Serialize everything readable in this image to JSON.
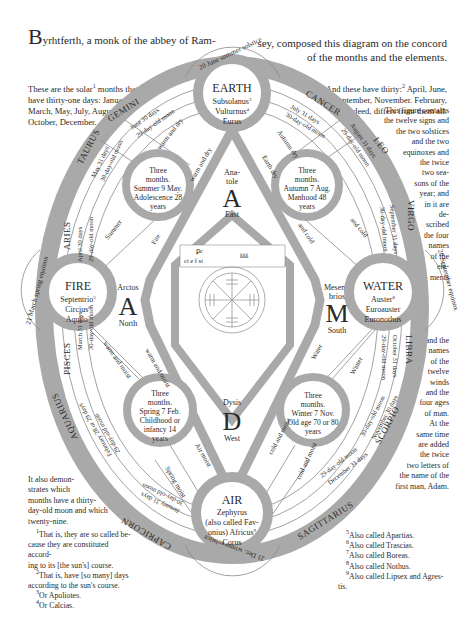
{
  "header": {
    "dropcap": "B",
    "title_left": "yrhtferth, a monk of the abbey of Ram-",
    "title_right_line1": "sey, composed this diagram on the concord",
    "title_right_line2": "of the months and the elements."
  },
  "side_text": {
    "top_left": [
      "These are the solar",
      "1",
      " months that",
      "have thirty-one days: January,",
      "March, May, July, August,",
      "October, December."
    ],
    "top_right": [
      "And these have thirty:",
      "2",
      " April, June,",
      "September, November. February,",
      "indeed, differs from them all."
    ],
    "right_column": [
      "This figure contains",
      "the twelve signs and",
      "the two solstices",
      "and the two",
      "equinoxes and",
      "the twice",
      "two sea-",
      "sons of the",
      "year; and",
      "in it are",
      "de-",
      "scribed",
      "the four",
      "names",
      "of the",
      "ele-",
      "ments",
      "",
      "and the",
      "names",
      "of the",
      "twelve",
      "winds",
      "and the",
      "four ages",
      "of man.",
      "At the",
      "same time",
      "are added",
      "the twice",
      "two letters of",
      "the name of the",
      "first man, Adam."
    ],
    "bottom_left": [
      "It also demon-",
      "strates which",
      "months have a thirty-",
      "day-old moon and which",
      "twenty-nine."
    ]
  },
  "footnotes": {
    "left": [
      {
        "num": "1",
        "text": "That is, they are so called be-"
      },
      {
        "num": "",
        "text": "cause they are constituted accord-"
      },
      {
        "num": "",
        "text": "ing to its [the sun's] course."
      },
      {
        "num": "2",
        "text": "That is, have [so many] days"
      },
      {
        "num": "",
        "text": "according to the sun's course."
      },
      {
        "num": "3",
        "text": "Or Apoliotes."
      },
      {
        "num": "4",
        "text": "Or Calcias."
      }
    ],
    "right": [
      {
        "num": "5",
        "text": "Also called Apartias."
      },
      {
        "num": "6",
        "text": "Also called Trascias."
      },
      {
        "num": "7",
        "text": "Also called Boreas."
      },
      {
        "num": "8",
        "text": "Also called Nothus."
      },
      {
        "num": "9",
        "text": "Also called Lipsex and Agres-"
      },
      {
        "num": "",
        "text": "tis."
      }
    ]
  },
  "diagram": {
    "colors": {
      "band": "#a9a9a9",
      "line": "#8a8a8a",
      "text": "#2a2a2a",
      "bg": "#ffffff"
    },
    "elements": {
      "earth": {
        "name": "EARTH",
        "winds": [
          "Subsolanus",
          "Vulturnus",
          "Eurus"
        ],
        "notes": [
          "3",
          "4",
          ""
        ]
      },
      "fire": {
        "name": "FIRE",
        "winds": [
          "Septentrio",
          "Circius",
          "Aquilo"
        ],
        "notes": [
          "5",
          "6",
          "7"
        ]
      },
      "water": {
        "name": "WATER",
        "winds": [
          "Auster",
          "Euroauster",
          "Euronothus"
        ],
        "notes": [
          "8",
          "",
          ""
        ]
      },
      "air": {
        "name": "AIR",
        "winds": [
          "Zephyrus",
          "(also called Fav-",
          "onius) Africus",
          "Corus"
        ],
        "notes": [
          "",
          "",
          "9",
          ""
        ]
      }
    },
    "solstices_equinoxes": {
      "summer": "20 June summer solstice",
      "winter": "21 Dec. winter solstice",
      "spring": "21 March spring equinox",
      "autumn": "20 September equinox"
    },
    "zodiac": [
      "GEMINI",
      "CANCER",
      "LEO",
      "VIRGO",
      "LIBRA",
      "SCORPIO",
      "SAGITTARIUS",
      "CAPRICORN",
      "AQUARIUS",
      "PISCES",
      "ARIES",
      "TAURUS"
    ],
    "months": {
      "june": [
        "June 30 days",
        "29-day-old moon"
      ],
      "july": [
        "July 31 days",
        "30-day-old moon"
      ],
      "august": [
        "August 31 days",
        "29-day-old moon"
      ],
      "september": [
        "September 31 days",
        "30-day-old moon"
      ],
      "october": [
        "October 31 days",
        "29-day-old moon"
      ],
      "november": [
        "November 30 days",
        "30-day-old moon"
      ],
      "december": [
        "December 31 days",
        "29-day-old moon"
      ],
      "january": [
        "January 31 days",
        "30-day-old moon"
      ],
      "february": [
        "February 28 or 29 days",
        "29-day-old moon"
      ],
      "march": [
        "March 31 days",
        "30-day-old moon"
      ],
      "april": [
        "April 30 days",
        "29-day-old moon"
      ],
      "may": [
        "May 31 days",
        "30-day-old moon"
      ]
    },
    "seasons": {
      "summer": [
        "Three",
        "months.",
        "Summer 9 May.",
        "Adolescence 28",
        "years"
      ],
      "autumn": [
        "Three",
        "months.",
        "Autumn 7 Aug.",
        "Manhood 48",
        "years"
      ],
      "spring": [
        "Three",
        "months.",
        "Spring 7 Feb.",
        "Childhood or",
        "infancy 14",
        "years"
      ],
      "winter": [
        "Three",
        "months.",
        "Winter 7 Nov.",
        "Old age 70 or 80",
        "years"
      ]
    },
    "qualities": {
      "summer_outer": "Summer",
      "summer_inner": "warm and dry",
      "summer_inner2": "warm and dry",
      "fire": "Fire",
      "earth": "Earth dry",
      "autumn": "Autumn dry",
      "autumn_cold": "and cold",
      "autumn_cold2": "and cold",
      "spring_moist": "warm and moist",
      "spring_moist2": "warm and moist",
      "spring": "Spring moist",
      "air": "Air moist",
      "winter_cold": "cold and moist",
      "winter_cold2": "cold and moist",
      "water": "Water",
      "winter": "Winter"
    },
    "adam": {
      "east": {
        "top": "Ana-",
        "mid": "tole",
        "letter": "A",
        "dir": "East"
      },
      "north": {
        "top": "Arctos",
        "letter": "A",
        "dir": "North"
      },
      "south": {
        "top": "Mesem-",
        "mid": "brios",
        "letter": "M",
        "dir": "South"
      },
      "west": {
        "top": "Dysis",
        "letter": "D",
        "dir": "West"
      }
    },
    "center": {
      "runes_line1": "ꝑc",
      "runes_line2": "ct e f st",
      "runes_right": "ßßß",
      "wheel_glyphs": [
        "ꝑc",
        "ßßß"
      ]
    }
  }
}
